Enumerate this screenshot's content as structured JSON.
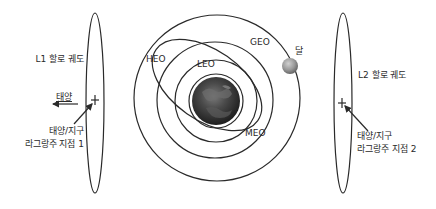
{
  "diagram": {
    "type": "orbit-diagram",
    "colors": {
      "line": "#2a2a2a",
      "text": "#2a2a2a",
      "earth_dark": "#2b2b2b",
      "earth_light": "#8a8a8a",
      "moon": "#9a9a9a",
      "background": "#ffffff"
    },
    "left": {
      "halo_label": "L1 할로 궤도",
      "sun_label": "태양",
      "point_label_line1": "태양/지구",
      "point_label_line2": "라그랑주 지점 1"
    },
    "right": {
      "halo_label": "L2 할로 궤도",
      "point_label_line1": "태양/지구",
      "point_label_line2": "라그랑주 지점 2"
    },
    "orbits": {
      "leo": "LEO",
      "meo": "MEO",
      "heo": "HEO",
      "geo": "GEO"
    },
    "moon_label": "달"
  }
}
